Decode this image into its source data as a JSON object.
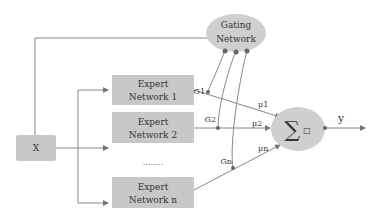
{
  "input": {
    "label": "X"
  },
  "gating": {
    "line1": "Gating",
    "line2": "Network"
  },
  "experts": [
    {
      "line1": "Expert",
      "line2": "Network 1"
    },
    {
      "line1": "Expert",
      "line2": "Network 2"
    },
    {
      "line1": "Expert",
      "line2": "Network n"
    }
  ],
  "ellipsis": "........",
  "gates": [
    "G1",
    "G2",
    "Gn"
  ],
  "weights": [
    "μ1",
    "μ2",
    "μn"
  ],
  "sum": {
    "symbol": "∑",
    "box": "□"
  },
  "output": {
    "label": "y"
  },
  "colors": {
    "box": "#c8c8c8",
    "ellipse": "#cfcfcf",
    "line": "#777777"
  }
}
